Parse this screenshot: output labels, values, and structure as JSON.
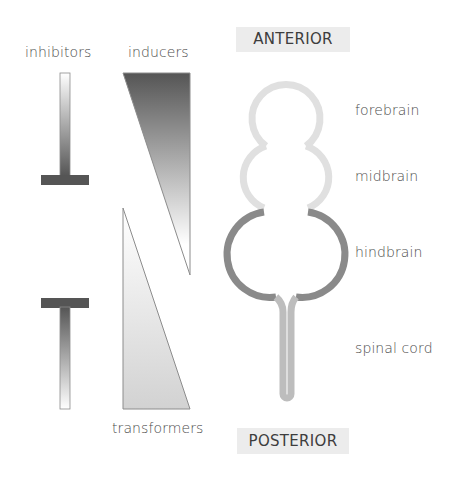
{
  "labels": {
    "inhibitors": "inhibitors",
    "inducers": "inducers",
    "transformers": "transformers",
    "anterior": "ANTERIOR",
    "posterior": "POSTERIOR"
  },
  "regions": [
    {
      "name": "forebrain",
      "label": "forebrain",
      "color": "#e0e0e0"
    },
    {
      "name": "midbrain",
      "label": "midbrain",
      "color": "#e0e0e0"
    },
    {
      "name": "hindbrain",
      "label": "hindbrain",
      "color": "#8a8a8a"
    },
    {
      "name": "spinal-cord",
      "label": "spinal cord",
      "color": "#bdbdbd"
    }
  ],
  "colors": {
    "dark": "#555555",
    "outline": "#8c8c8c",
    "box": "#ececec"
  }
}
